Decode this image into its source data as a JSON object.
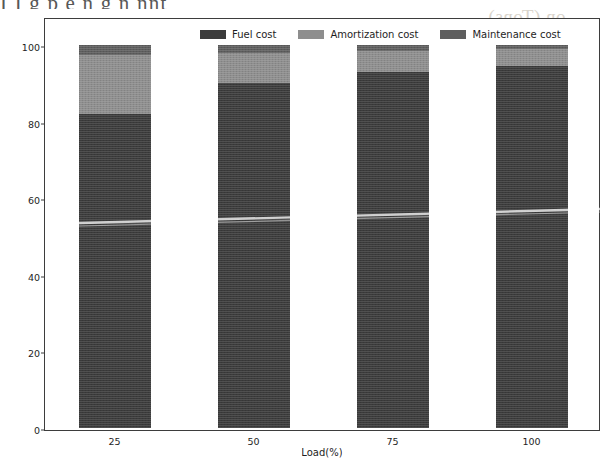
{
  "scan": {
    "top_cropped_text": "I I g    p                                    e    n           g  n nnt",
    "bleed_text": "on (Tons)"
  },
  "legend": {
    "position": "upper-center",
    "items": [
      {
        "label": "Fuel cost",
        "color": "#3b3b3b",
        "key": "fuel"
      },
      {
        "label": "Amortization cost",
        "color": "#8e8e8e",
        "key": "amortization"
      },
      {
        "label": "Maintenance cost",
        "color": "#5e5e5e",
        "key": "maintenance"
      }
    ]
  },
  "axes": {
    "ylabel": "Share of the total cost (%)",
    "xlabel": "Load(%)",
    "yticks": [
      "0",
      "20",
      "40",
      "60",
      "80",
      "100"
    ],
    "xticks": [
      "25",
      "50",
      "75",
      "100"
    ]
  },
  "chart_data": {
    "type": "bar",
    "stacked": true,
    "title": "",
    "xlabel": "Load(%)",
    "ylabel": "Share of the total cost (%)",
    "categories": [
      "25",
      "50",
      "75",
      "100"
    ],
    "ylim": [
      0,
      100
    ],
    "xlim_note": "categorical, 4 bars",
    "grid": false,
    "legend_position": "upper-center",
    "series": [
      {
        "name": "Fuel cost",
        "color": "#3b3b3b",
        "values": [
          82.0,
          90.0,
          93.0,
          94.5
        ]
      },
      {
        "name": "Amortization cost",
        "color": "#8e8e8e",
        "values": [
          15.5,
          8.0,
          5.5,
          4.5
        ]
      },
      {
        "name": "Maintenance cost",
        "color": "#5e5e5e",
        "values": [
          2.5,
          2.0,
          1.5,
          1.0
        ]
      }
    ],
    "totals": [
      100,
      100,
      100,
      100
    ]
  }
}
